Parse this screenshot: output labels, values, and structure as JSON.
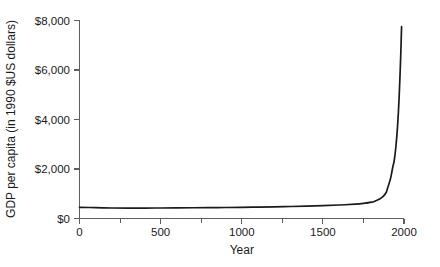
{
  "chart_data": {
    "type": "line",
    "title": "",
    "xlabel": "Year",
    "ylabel": "GDP per capita (in 1990 $US dollars)",
    "xlim": [
      0,
      2000
    ],
    "ylim": [
      0,
      8000
    ],
    "grid": false,
    "legend": null,
    "x_ticks": [
      0,
      500,
      1000,
      1500,
      2000
    ],
    "x_tick_labels": [
      "0",
      "500",
      "1000",
      "1500",
      "2000"
    ],
    "x_minor_ticks": [
      250,
      750,
      1250,
      1750
    ],
    "y_ticks": [
      0,
      2000,
      4000,
      6000,
      8000
    ],
    "y_tick_labels": [
      "$0",
      "$2,000",
      "$4,000",
      "$6,000",
      "$8,000"
    ],
    "series": [
      {
        "name": "GDP per capita",
        "color": "#1a1a1a",
        "x": [
          0,
          100,
          200,
          300,
          400,
          500,
          600,
          700,
          800,
          900,
          1000,
          1100,
          1200,
          1300,
          1400,
          1500,
          1600,
          1700,
          1750,
          1800,
          1820,
          1850,
          1870,
          1890,
          1900,
          1913,
          1920,
          1930,
          1940,
          1950,
          1960,
          1970,
          1980,
          1985
        ],
        "values": [
          450,
          440,
          425,
          420,
          420,
          425,
          430,
          435,
          440,
          445,
          450,
          460,
          470,
          485,
          500,
          520,
          545,
          580,
          610,
          660,
          700,
          790,
          880,
          1050,
          1250,
          1520,
          1700,
          2050,
          2350,
          2900,
          3700,
          4900,
          6600,
          7750
        ]
      }
    ]
  },
  "axis": {
    "x_axis_name": "x-axis",
    "y_axis_name": "y-axis"
  }
}
